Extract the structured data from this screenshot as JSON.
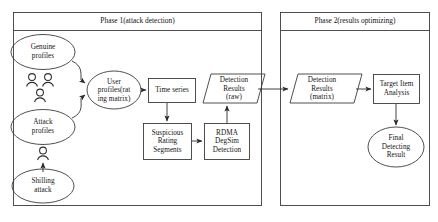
{
  "diagram": {
    "type": "flowchart",
    "phases": [
      {
        "id": "phase-1",
        "title": "Phase 1(attack detection)"
      },
      {
        "id": "phase-2",
        "title": "Phase 2(results optimizing)"
      }
    ],
    "nodes": {
      "genuine_profiles": {
        "shape": "ellipse",
        "lines": [
          "Genuine",
          "profiles"
        ]
      },
      "attack_profiles": {
        "shape": "ellipse",
        "lines": [
          "Attack",
          "profiles"
        ]
      },
      "shilling_attack": {
        "shape": "ellipse",
        "lines": [
          "Shilling",
          "attack"
        ]
      },
      "user_profiles": {
        "shape": "ellipse",
        "lines": [
          "User",
          "profiles(rat",
          "ing matrix)"
        ]
      },
      "time_series": {
        "shape": "rectangle",
        "lines": [
          "Time series"
        ]
      },
      "suspicious_rating_segments": {
        "shape": "rectangle",
        "lines": [
          "Suspicious",
          "Rating",
          "Segments"
        ]
      },
      "rdma_degsim_detection": {
        "shape": "rectangle",
        "lines": [
          "RDMA",
          "DegSim",
          "Detection"
        ]
      },
      "detection_results_raw": {
        "shape": "parallelogram",
        "lines": [
          "Detection",
          "Results",
          "(raw)"
        ]
      },
      "detection_results_matrix": {
        "shape": "parallelogram",
        "lines": [
          "Detection",
          "Results",
          "(matrix)"
        ]
      },
      "target_item_analysis": {
        "shape": "rectangle",
        "lines": [
          "Target Item",
          "Analysis"
        ]
      },
      "final_detecting_result": {
        "shape": "ellipse",
        "lines": [
          "Final",
          "Detecting",
          "Result"
        ]
      }
    },
    "icons": {
      "genuine_users_group": "user-group-icon",
      "attacker_user": "user-icon"
    },
    "colors": {
      "stroke": "#3c3c3c",
      "text": "#141414",
      "background": "#ffffff"
    }
  }
}
